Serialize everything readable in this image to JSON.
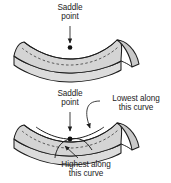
{
  "figure": {
    "style": {
      "surface_fill": "#d4d4d4",
      "surface_front_fill": "#dcdcdc",
      "surface_end_fill": "#c9c9c9",
      "outline": "#1d1d1d",
      "background": "#ffffff",
      "text_color": "#1c1c1c"
    }
  },
  "panels": [
    {
      "id": "top-panel",
      "name": "saddle-surface-plain",
      "labels": [
        {
          "id": "saddle-point-top",
          "line1": "Saddle",
          "line2": "point",
          "pointer": "arrow-down"
        }
      ]
    },
    {
      "id": "bottom-panel",
      "name": "saddle-surface-annotated",
      "labels": [
        {
          "id": "saddle-point-bottom",
          "line1": "Saddle",
          "line2": "point",
          "pointer": "arrow-down"
        },
        {
          "id": "lowest-along-curve",
          "line1": "Lowest along",
          "line2": "this curve",
          "pointer": "curved-leader-arrow"
        },
        {
          "id": "highest-along-curve",
          "line1": "Highest along",
          "line2": "this curve",
          "pointer": "straight-leader-arrow"
        }
      ]
    }
  ]
}
